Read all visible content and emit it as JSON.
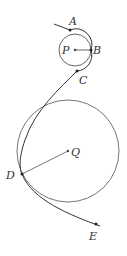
{
  "diagram": {
    "type": "geometry",
    "circles": [
      {
        "name": "P",
        "cx": 75,
        "cy": 50,
        "r": 16
      },
      {
        "name": "Q",
        "cx": 68,
        "cy": 151,
        "r": 51
      }
    ],
    "points": [
      {
        "label": "A",
        "x": 70,
        "y": 30
      },
      {
        "label": "B",
        "x": 91,
        "y": 50
      },
      {
        "label": "C",
        "x": 77,
        "y": 71
      },
      {
        "label": "D",
        "x": 22,
        "y": 174
      },
      {
        "label": "E",
        "x": 96,
        "y": 223
      },
      {
        "label": "P",
        "x": 75,
        "y": 50
      },
      {
        "label": "Q",
        "x": 68,
        "y": 151
      }
    ],
    "segments": [
      {
        "from": "P",
        "to": "B"
      },
      {
        "from": "Q",
        "to": "D"
      }
    ],
    "colors": {
      "stroke": "#555555",
      "curve": "#333333",
      "point": "#222222"
    }
  }
}
